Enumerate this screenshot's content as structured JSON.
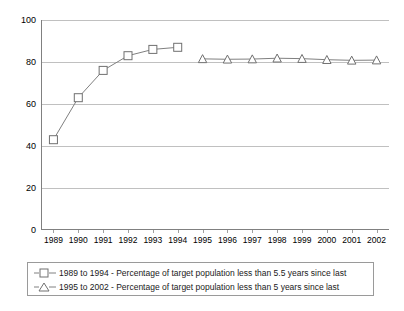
{
  "chart_data": {
    "type": "line",
    "title": "",
    "subtitle": "",
    "xlabel": "",
    "ylabel": "",
    "x": [
      1989,
      1990,
      1991,
      1992,
      1993,
      1994,
      1995,
      1996,
      1997,
      1998,
      1999,
      2000,
      2001,
      2002
    ],
    "xtick_labels": [
      "1989",
      "1990",
      "1991",
      "1992",
      "1993",
      "1994",
      "1995",
      "1996",
      "1997",
      "1998",
      "1999",
      "2000",
      "2001",
      "2002"
    ],
    "ytick_labels": [
      "0",
      "20",
      "40",
      "60",
      "80",
      "100"
    ],
    "yticks": [
      0,
      20,
      40,
      60,
      80,
      100
    ],
    "ylim": [
      0,
      100
    ],
    "xlim": [
      1988.5,
      2002.5
    ],
    "grid": "horizontal",
    "legend_position": "bottom",
    "series": [
      {
        "name": "1989 to 1994 - Percentage of target population less than 5.5 years since last",
        "marker": "square",
        "color": "#808080",
        "x": [
          1989,
          1990,
          1991,
          1992,
          1993,
          1994
        ],
        "values": [
          43,
          63,
          76,
          83,
          86,
          87
        ]
      },
      {
        "name": "1995 to 2002 - Percentage of target population less than 5 years since last",
        "marker": "triangle",
        "color": "#808080",
        "x": [
          1995,
          1996,
          1997,
          1998,
          1999,
          2000,
          2001,
          2002
        ],
        "values": [
          81.5,
          81.3,
          81.4,
          81.8,
          81.6,
          81.1,
          80.8,
          80.9
        ]
      }
    ]
  },
  "legend": {
    "items": [
      {
        "marker": "square-marker-icon",
        "label": "1989 to 1994 - Percentage of target population less than 5.5 years since last"
      },
      {
        "marker": "triangle-marker-icon",
        "label": "1995 to 2002 - Percentage of target population less than 5 years since last"
      }
    ]
  },
  "colors": {
    "series_line": "#808080",
    "gridline": "#c0c0c0",
    "axis": "#808080",
    "text": "#000000",
    "legend_border": "#9a9a9a",
    "background": "#ffffff"
  }
}
